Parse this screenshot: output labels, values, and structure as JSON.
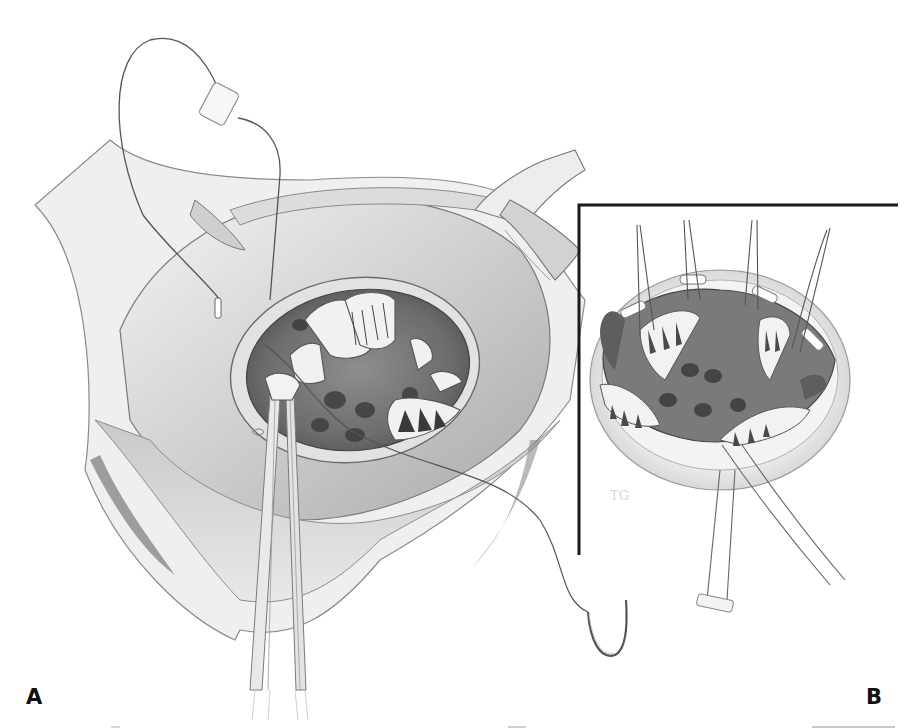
{
  "figure": {
    "type": "surgical illustration",
    "palette": {
      "background": "#ffffff",
      "ink": "#111111",
      "tissue_light": "#e6e6e6",
      "tissue_mid": "#b9b9b9",
      "tissue_dark": "#6e6e6e",
      "frame": "#1a1a1a"
    },
    "panels": [
      {
        "id": "A",
        "label": "A",
        "description": "Open atrium with retractors, forceps grasping annulus, pledgeted suture and curved needle"
      },
      {
        "id": "B",
        "label": "B",
        "description": "Inset: valve annulus with pledgeted sutures placed around the ring, framed by L-shaped border"
      }
    ]
  }
}
